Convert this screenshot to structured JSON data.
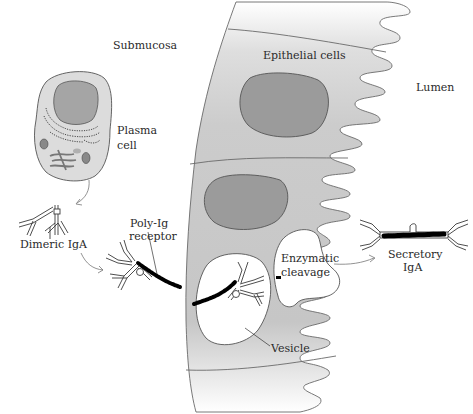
{
  "figure": {
    "type": "diagram",
    "colors": {
      "background": "#ffffff",
      "cell_fill": "#c9c9c9",
      "cell_fill_light": "#e4e4e4",
      "nucleus_fill": "#9a9a9a",
      "plasma_cell_fill": "#dcdcdc",
      "outline": "#555555",
      "receptor": "#000000",
      "text": "#2a2a2a"
    }
  },
  "labels": {
    "submucosa": "Submucosa",
    "epithelial_cells": "Epithelial cells",
    "lumen": "Lumen",
    "plasma_cell_line1": "Plasma",
    "plasma_cell_line2": "cell",
    "dimeric_iga": "Dimeric IgA",
    "poly_ig_line1": "Poly-Ig",
    "poly_ig_line2": "receptor",
    "enzymatic_line1": "Enzymatic",
    "enzymatic_line2": "cleavage",
    "secretory_line1": "Secretory",
    "secretory_line2": "IgA",
    "vesicle": "Vesicle"
  },
  "regions": [
    {
      "name": "Submucosa",
      "side": "left"
    },
    {
      "name": "Epithelial cells",
      "side": "center"
    },
    {
      "name": "Lumen",
      "side": "right"
    }
  ],
  "process_steps": [
    "Plasma cell secretes dimeric IgA",
    "Dimeric IgA binds poly-Ig receptor on basolateral surface",
    "Complex internalized in vesicle and transported across cell",
    "Enzymatic cleavage releases secretory IgA into lumen"
  ]
}
